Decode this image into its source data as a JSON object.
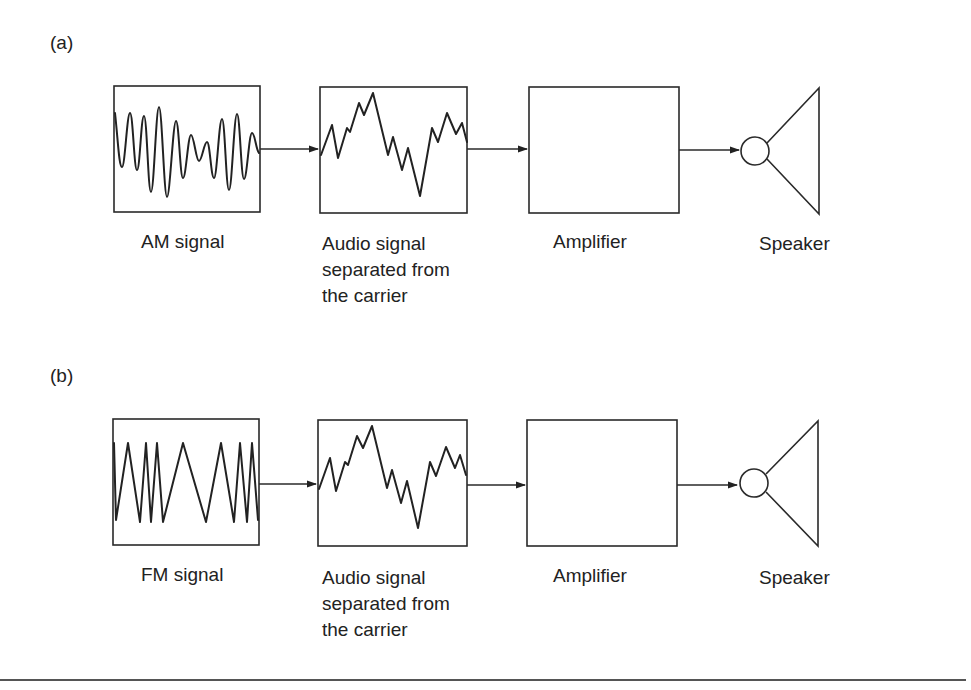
{
  "figure": {
    "panels": [
      {
        "id": "a",
        "label": "(a)",
        "stages": [
          {
            "name": "input-signal",
            "caption_lines": [
              "AM signal"
            ],
            "waveform": "am-signal"
          },
          {
            "name": "demodulated-audio",
            "caption_lines": [
              "Audio signal",
              "separated from",
              "the carrier"
            ],
            "waveform": "audio-signal"
          },
          {
            "name": "amplifier",
            "caption_lines": [
              "Amplifier"
            ]
          },
          {
            "name": "speaker",
            "caption_lines": [
              "Speaker"
            ]
          }
        ]
      },
      {
        "id": "b",
        "label": "(b)",
        "stages": [
          {
            "name": "input-signal",
            "caption_lines": [
              "FM signal"
            ],
            "waveform": "fm-signal"
          },
          {
            "name": "demodulated-audio",
            "caption_lines": [
              "Audio signal",
              "separated from",
              "the carrier"
            ],
            "waveform": "audio-signal"
          },
          {
            "name": "amplifier",
            "caption_lines": [
              "Amplifier"
            ]
          },
          {
            "name": "speaker",
            "caption_lines": [
              "Speaker"
            ]
          }
        ]
      }
    ],
    "flow": [
      "signal",
      "audio",
      "amplifier",
      "speaker"
    ],
    "colors": {
      "line": "#2a2a2a",
      "text": "#222222",
      "background": "#ffffff"
    }
  }
}
